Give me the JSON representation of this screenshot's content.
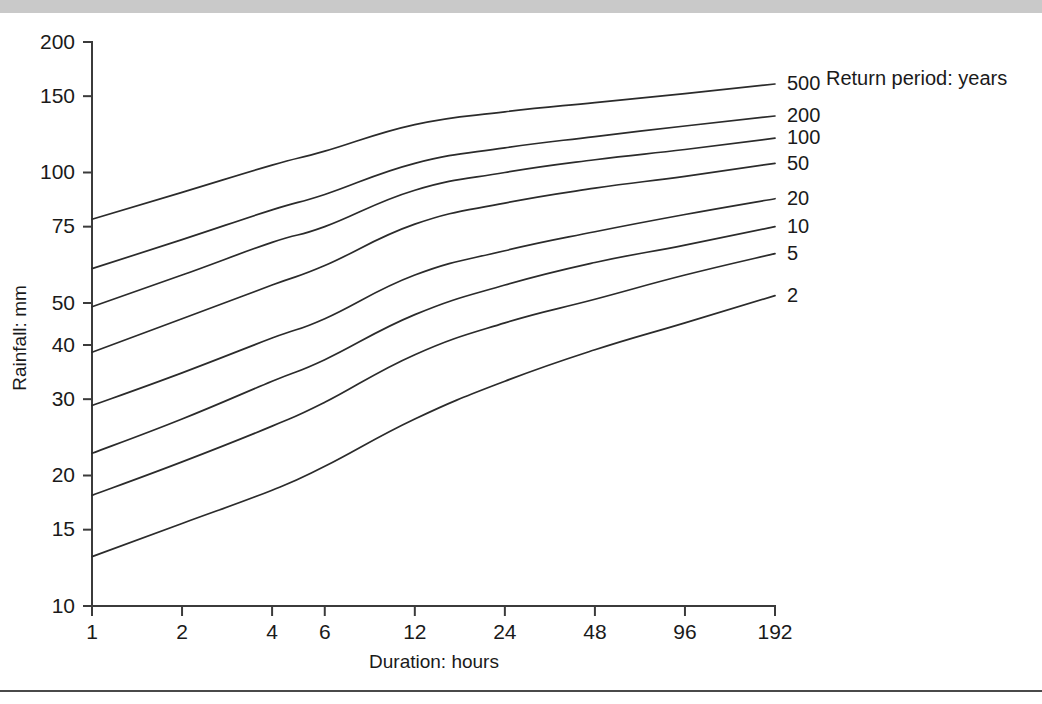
{
  "figure": {
    "background_color": "#ffffff",
    "band_color": "#c9c9c9",
    "line_color": "#2b2b2b",
    "axis_color": "#3b3b3b"
  },
  "legend": {
    "title": "Return period: years"
  },
  "axes": {
    "x_title": "Duration: hours",
    "y_title": "Rainfall: mm"
  },
  "chart_data": {
    "type": "line",
    "title": "",
    "xlabel": "Duration: hours",
    "ylabel": "Rainfall: mm",
    "xscale": "log",
    "yscale": "log",
    "xlim": [
      1,
      192
    ],
    "ylim": [
      10,
      200
    ],
    "grid": false,
    "legend_position": "right",
    "legend_title": "Return period: years",
    "x": [
      1,
      2,
      4,
      6,
      12,
      24,
      48,
      96,
      192
    ],
    "xticks": [
      1,
      2,
      4,
      6,
      12,
      24,
      48,
      96,
      192
    ],
    "xtick_labels": [
      "1",
      "2",
      "4",
      "6",
      "12",
      "24",
      "48",
      "96",
      "192"
    ],
    "yticks": [
      10,
      15,
      20,
      30,
      40,
      50,
      75,
      100,
      150,
      200
    ],
    "ytick_labels": [
      "10",
      "15",
      "20",
      "30",
      "40",
      "50",
      "75",
      "100",
      "150",
      "200"
    ],
    "series": [
      {
        "name": "500",
        "label": "500",
        "values": [
          78,
          90,
          104,
          112,
          129,
          138,
          145,
          152,
          160
        ]
      },
      {
        "name": "200",
        "label": "200",
        "values": [
          60,
          70,
          82,
          89,
          105,
          114,
          121,
          128,
          135
        ]
      },
      {
        "name": "100",
        "label": "100",
        "values": [
          49,
          58,
          69,
          75,
          91,
          100,
          107,
          113,
          120
        ]
      },
      {
        "name": "50",
        "label": "50",
        "values": [
          38.5,
          46,
          55,
          61,
          76,
          85,
          92,
          98,
          105
        ]
      },
      {
        "name": "20",
        "label": "20",
        "values": [
          29,
          34.5,
          41.5,
          46,
          58,
          66,
          73,
          80,
          87
        ]
      },
      {
        "name": "10",
        "label": "10",
        "values": [
          22.5,
          27,
          33,
          37,
          47,
          55,
          62,
          68,
          75
        ]
      },
      {
        "name": "5",
        "label": "5",
        "values": [
          18,
          21.5,
          26,
          29.5,
          38,
          45,
          51,
          58,
          65
        ]
      },
      {
        "name": "2",
        "label": "2",
        "values": [
          13,
          15.5,
          18.5,
          21,
          27,
          33,
          39,
          45,
          52
        ]
      }
    ]
  }
}
